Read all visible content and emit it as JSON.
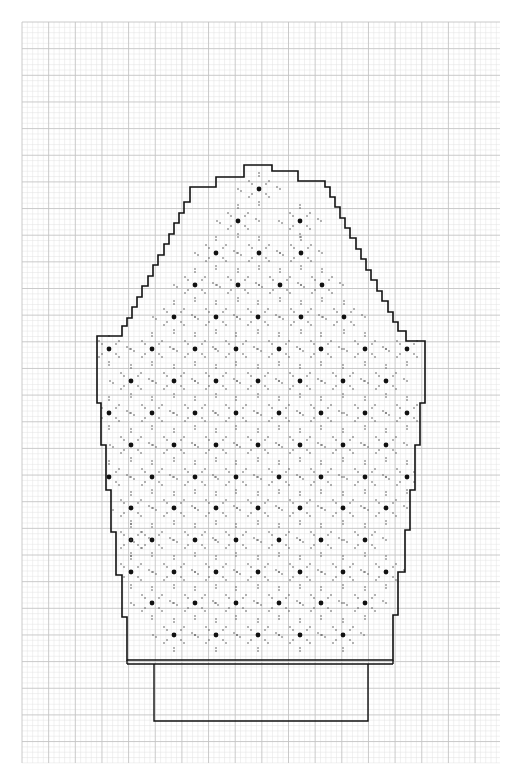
{
  "canvas": {
    "width": 518,
    "height": 783,
    "background": "#ffffff"
  },
  "grid": {
    "x0": 22,
    "y0": 22,
    "x1": 500,
    "y1": 763,
    "fine_step": 5.33,
    "major_every": 5,
    "fine_color": "#e3e3e3",
    "major_color": "#c4c4c4"
  },
  "outline": {
    "stroke": "#111111",
    "stroke_width": 1.6,
    "points": [
      [
        244,
        165
      ],
      [
        272,
        165
      ],
      [
        272,
        171
      ],
      [
        298,
        171
      ],
      [
        298,
        181
      ],
      [
        325,
        181
      ],
      [
        325,
        187
      ],
      [
        330,
        187
      ],
      [
        330,
        197
      ],
      [
        335,
        197
      ],
      [
        335,
        207
      ],
      [
        340,
        207
      ],
      [
        340,
        218
      ],
      [
        345,
        218
      ],
      [
        345,
        228
      ],
      [
        350,
        228
      ],
      [
        350,
        238
      ],
      [
        356,
        238
      ],
      [
        356,
        249
      ],
      [
        361,
        249
      ],
      [
        361,
        259
      ],
      [
        366,
        259
      ],
      [
        366,
        270
      ],
      [
        371,
        270
      ],
      [
        371,
        280
      ],
      [
        377,
        280
      ],
      [
        377,
        291
      ],
      [
        382,
        291
      ],
      [
        382,
        301
      ],
      [
        388,
        301
      ],
      [
        388,
        312
      ],
      [
        393,
        312
      ],
      [
        393,
        322
      ],
      [
        398,
        322
      ],
      [
        398,
        331
      ],
      [
        406,
        331
      ],
      [
        406,
        341
      ],
      [
        425,
        341
      ],
      [
        425,
        403
      ],
      [
        420,
        403
      ],
      [
        420,
        445
      ],
      [
        415,
        445
      ],
      [
        415,
        490
      ],
      [
        410,
        490
      ],
      [
        410,
        530
      ],
      [
        405,
        530
      ],
      [
        405,
        572
      ],
      [
        398,
        572
      ],
      [
        398,
        615
      ],
      [
        393,
        615
      ],
      [
        393,
        660
      ],
      [
        127,
        660
      ],
      [
        127,
        617
      ],
      [
        122,
        617
      ],
      [
        122,
        575
      ],
      [
        116,
        575
      ],
      [
        116,
        532
      ],
      [
        111,
        532
      ],
      [
        111,
        490
      ],
      [
        106,
        490
      ],
      [
        106,
        445
      ],
      [
        101,
        445
      ],
      [
        101,
        403
      ],
      [
        97,
        403
      ],
      [
        97,
        336
      ],
      [
        122,
        336
      ],
      [
        122,
        326
      ],
      [
        127,
        326
      ],
      [
        127,
        318
      ],
      [
        132,
        318
      ],
      [
        132,
        307
      ],
      [
        137,
        307
      ],
      [
        137,
        297
      ],
      [
        142,
        297
      ],
      [
        142,
        286
      ],
      [
        148,
        286
      ],
      [
        148,
        276
      ],
      [
        153,
        276
      ],
      [
        153,
        265
      ],
      [
        158,
        265
      ],
      [
        158,
        255
      ],
      [
        164,
        255
      ],
      [
        164,
        244
      ],
      [
        169,
        244
      ],
      [
        169,
        234
      ],
      [
        174,
        234
      ],
      [
        174,
        223
      ],
      [
        179,
        223
      ],
      [
        179,
        213
      ],
      [
        184,
        213
      ],
      [
        184,
        202
      ],
      [
        190,
        202
      ],
      [
        190,
        187
      ],
      [
        216,
        187
      ],
      [
        216,
        177
      ],
      [
        244,
        177
      ]
    ]
  },
  "cuff": {
    "band": {
      "x0": 127,
      "x1": 393,
      "y_top": 660,
      "y_bottom": 664
    },
    "rect": {
      "x0": 154,
      "x1": 368,
      "y0": 664,
      "y1": 721
    },
    "stroke": "#111111"
  },
  "motif": {
    "big_dot_color": "#111111",
    "big_dot_radius": 2.4,
    "small_dot_color": "#555555",
    "small_dot_radius": 0.8,
    "col_step": 42.7,
    "row_step": 31.8,
    "rows": [
      {
        "y": 189,
        "xs": [
          259
        ]
      },
      {
        "y": 221,
        "xs": [
          238,
          300
        ]
      },
      {
        "y": 253,
        "xs": [
          216,
          259,
          301
        ]
      },
      {
        "y": 285,
        "xs": [
          195,
          238,
          280,
          322
        ]
      },
      {
        "y": 317,
        "xs": [
          174,
          216,
          258,
          301,
          344
        ]
      },
      {
        "y": 349,
        "xs": [
          109,
          152,
          195,
          236,
          279,
          321,
          365,
          407
        ]
      },
      {
        "y": 381,
        "xs": [
          131,
          174,
          216,
          258,
          300,
          343,
          386
        ]
      },
      {
        "y": 413,
        "xs": [
          109,
          152,
          195,
          236,
          279,
          321,
          365,
          407
        ]
      },
      {
        "y": 445,
        "xs": [
          131,
          174,
          216,
          258,
          300,
          343,
          386
        ]
      },
      {
        "y": 477,
        "xs": [
          109,
          152,
          195,
          236,
          279,
          321,
          365,
          407
        ]
      },
      {
        "y": 508,
        "xs": [
          131,
          174,
          216,
          258,
          300,
          343,
          386
        ]
      },
      {
        "y": 540,
        "xs": [
          131,
          152,
          195,
          236,
          279,
          321,
          365
        ]
      },
      {
        "y": 572,
        "xs": [
          131,
          174,
          216,
          258,
          300,
          343,
          386
        ]
      },
      {
        "y": 603,
        "xs": [
          152,
          195,
          236,
          279,
          321,
          365
        ]
      },
      {
        "y": 635,
        "xs": [
          174,
          216,
          258,
          300,
          343
        ]
      }
    ]
  }
}
